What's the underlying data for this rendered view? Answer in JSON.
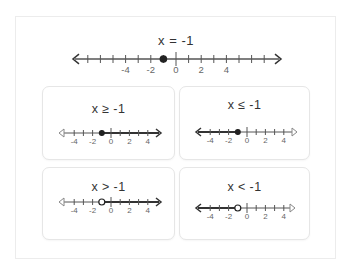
{
  "main": {
    "title": "x = -1",
    "point": -1,
    "point_style": "closed",
    "ticks": [
      -4,
      -2,
      0,
      2,
      4
    ],
    "range": [
      -7,
      8
    ]
  },
  "cards": [
    {
      "title": "x ≥ -1",
      "point": -1,
      "point_style": "closed",
      "shade": "right",
      "ticks": [
        -4,
        -2,
        0,
        2,
        4
      ]
    },
    {
      "title": "x ≤ -1",
      "point": -1,
      "point_style": "closed",
      "shade": "left",
      "ticks": [
        -4,
        -2,
        0,
        2,
        4
      ]
    },
    {
      "title": "x > -1",
      "point": -1,
      "point_style": "open",
      "shade": "right",
      "ticks": [
        -4,
        -2,
        0,
        2,
        4
      ]
    },
    {
      "title": "x < -1",
      "point": -1,
      "point_style": "open",
      "shade": "left",
      "ticks": [
        -4,
        -2,
        0,
        2,
        4
      ]
    }
  ],
  "colors": {
    "line": "#555555",
    "shaded": "#333333",
    "point": "#222222",
    "tick_label": "#666666"
  }
}
